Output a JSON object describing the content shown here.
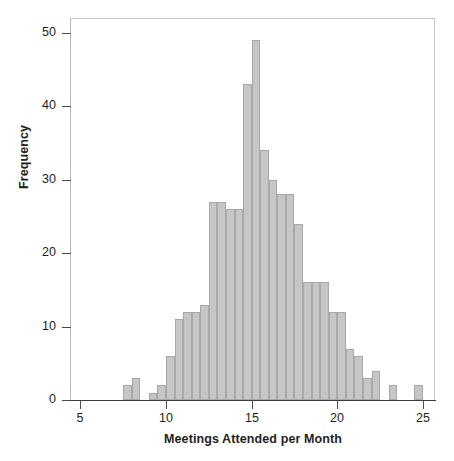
{
  "chart_data": {
    "type": "bar",
    "title": "",
    "xlabel": "Meetings Attended per Month",
    "ylabel": "Frequency",
    "xlim": [
      4.4,
      25.7
    ],
    "ylim": [
      0,
      52
    ],
    "xticks": [
      5,
      10,
      15,
      20,
      25
    ],
    "yticks": [
      0,
      10,
      20,
      30,
      40,
      50
    ],
    "grid": false,
    "legend": null,
    "bin_width": 0.5,
    "bar_color": "#c6c6c6",
    "bar_edge_color": "#a8a8a8",
    "bins": [
      {
        "left": 7.5,
        "right": 8.0,
        "value": 2
      },
      {
        "left": 8.0,
        "right": 8.5,
        "value": 3
      },
      {
        "left": 8.5,
        "right": 9.0,
        "value": 0
      },
      {
        "left": 9.0,
        "right": 9.5,
        "value": 1
      },
      {
        "left": 9.5,
        "right": 10.0,
        "value": 2
      },
      {
        "left": 10.0,
        "right": 10.5,
        "value": 6
      },
      {
        "left": 10.5,
        "right": 11.0,
        "value": 11
      },
      {
        "left": 11.0,
        "right": 11.5,
        "value": 12
      },
      {
        "left": 11.5,
        "right": 12.0,
        "value": 12
      },
      {
        "left": 12.0,
        "right": 12.5,
        "value": 13
      },
      {
        "left": 12.5,
        "right": 13.0,
        "value": 27
      },
      {
        "left": 13.0,
        "right": 13.5,
        "value": 27
      },
      {
        "left": 13.5,
        "right": 14.0,
        "value": 26
      },
      {
        "left": 14.0,
        "right": 14.5,
        "value": 26
      },
      {
        "left": 14.5,
        "right": 15.0,
        "value": 43
      },
      {
        "left": 15.0,
        "right": 15.5,
        "value": 49
      },
      {
        "left": 15.5,
        "right": 16.0,
        "value": 34
      },
      {
        "left": 16.0,
        "right": 16.5,
        "value": 30
      },
      {
        "left": 16.5,
        "right": 17.0,
        "value": 28
      },
      {
        "left": 17.0,
        "right": 17.5,
        "value": 28
      },
      {
        "left": 17.5,
        "right": 18.0,
        "value": 24
      },
      {
        "left": 18.0,
        "right": 18.5,
        "value": 16
      },
      {
        "left": 18.5,
        "right": 19.0,
        "value": 16
      },
      {
        "left": 19.0,
        "right": 19.5,
        "value": 16
      },
      {
        "left": 19.5,
        "right": 20.0,
        "value": 12
      },
      {
        "left": 20.0,
        "right": 20.5,
        "value": 12
      },
      {
        "left": 20.5,
        "right": 21.0,
        "value": 7
      },
      {
        "left": 21.0,
        "right": 21.5,
        "value": 6
      },
      {
        "left": 21.5,
        "right": 22.0,
        "value": 3
      },
      {
        "left": 22.0,
        "right": 22.5,
        "value": 4
      },
      {
        "left": 23.0,
        "right": 23.5,
        "value": 2
      },
      {
        "left": 24.5,
        "right": 25.0,
        "value": 2
      }
    ]
  },
  "axis": {
    "y_tick_labels": [
      "0",
      "10",
      "20",
      "30",
      "40",
      "50"
    ],
    "x_tick_labels": [
      "5",
      "10",
      "15",
      "20",
      "25"
    ],
    "x_title": "Meetings Attended per Month",
    "y_title": "Frequency"
  }
}
